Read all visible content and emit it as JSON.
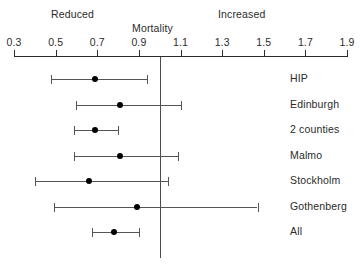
{
  "chart_data": {
    "type": "scatter",
    "subtype": "forest-plot",
    "title": "",
    "xlabel": "Mortality",
    "ylabel": "",
    "xlim": [
      0.3,
      1.9
    ],
    "xticks": [
      0.3,
      0.5,
      0.7,
      0.9,
      1.1,
      1.3,
      1.5,
      1.7,
      1.9
    ],
    "xticklabels": [
      "0.3",
      "0.5",
      "0.7",
      "0.9",
      "1.1",
      "1.3",
      "1.5",
      "1.7",
      "1.9"
    ],
    "grid": false,
    "legend": "none",
    "reference_line": 1.0,
    "annotations": [
      {
        "text": "Reduced",
        "x": 0.48,
        "position": "above-axis-left"
      },
      {
        "text": "Mortality",
        "x": 1.0,
        "position": "above-axis-center"
      },
      {
        "text": "Increased",
        "x": 1.32,
        "position": "above-axis-right"
      }
    ],
    "categories": [
      "HIP",
      "Edinburgh",
      "2 counties",
      "Malmo",
      "Stockholm",
      "Gothenberg",
      "All"
    ],
    "values": [
      0.69,
      0.81,
      0.69,
      0.81,
      0.66,
      0.89,
      0.78
    ],
    "ci_low": [
      0.48,
      0.6,
      0.59,
      0.59,
      0.4,
      0.49,
      0.675
    ],
    "ci_high": [
      0.94,
      1.1,
      0.8,
      1.09,
      1.04,
      1.47,
      0.9
    ],
    "points": [
      {
        "label": "HIP",
        "estimate": 0.69,
        "ci_low": 0.48,
        "ci_high": 0.94
      },
      {
        "label": "Edinburgh",
        "estimate": 0.81,
        "ci_low": 0.6,
        "ci_high": 1.1
      },
      {
        "label": "2 counties",
        "estimate": 0.69,
        "ci_low": 0.59,
        "ci_high": 0.8
      },
      {
        "label": "Malmo",
        "estimate": 0.81,
        "ci_low": 0.59,
        "ci_high": 1.09
      },
      {
        "label": "Stockholm",
        "estimate": 0.66,
        "ci_low": 0.4,
        "ci_high": 1.04
      },
      {
        "label": "Gothenberg",
        "estimate": 0.89,
        "ci_low": 0.49,
        "ci_high": 1.47
      },
      {
        "label": "All",
        "estimate": 0.78,
        "ci_low": 0.675,
        "ci_high": 0.9
      }
    ]
  },
  "colors": {
    "axis": "#2b2b2b",
    "reference_line": "#4a4a4a",
    "ci_line": "#555555",
    "point": "#000000",
    "text": "#2b2b2b",
    "background": "#ffffff"
  },
  "geometry": {
    "axis_left_px": 14,
    "axis_right_px": 347,
    "axis_y_px": 56,
    "first_row_y_px": 68,
    "row_step_px": 25.5,
    "label_x_px": 290
  }
}
